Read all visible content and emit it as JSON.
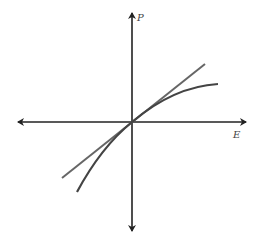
{
  "diagram": {
    "type": "P-E polarization curve with linear tangent",
    "axes": {
      "x_label": "E",
      "y_label": "P"
    },
    "curves": [
      {
        "name": "linear-response",
        "kind": "straight line through origin"
      },
      {
        "name": "nonlinear-response",
        "kind": "saturating curve through origin"
      }
    ],
    "colors": {
      "axis": "#222222",
      "line": "#666666",
      "curve": "#444444",
      "label": "#444444"
    }
  }
}
